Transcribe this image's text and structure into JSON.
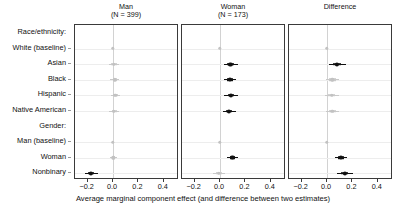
{
  "chart_data": {
    "type": "scatter",
    "plot_kind": "coefficient-forest-plot",
    "title": "",
    "xlabel": "Average marginal component effect (and difference between two estimates)",
    "ylabel": "",
    "xlim": [
      -0.3,
      0.52
    ],
    "xticks": [
      -0.2,
      0.0,
      0.2,
      0.4
    ],
    "xticklabels": [
      "−0.2",
      "0.0",
      "0.2",
      "0.4"
    ],
    "grid": false,
    "legend": "none",
    "reference_line": 0.0,
    "row_groups": [
      {
        "header": "Race/ethnicity:",
        "rows": [
          "White (baseline)",
          "Asian",
          "Black",
          "Hispanic",
          "Native American"
        ]
      },
      {
        "header": "Gender:",
        "rows": [
          "Man (baseline)",
          "Woman",
          "Nonbinary"
        ]
      }
    ],
    "categories": [
      "Race/ethnicity:",
      "White (baseline)",
      "Asian",
      "Black",
      "Hispanic",
      "Native American",
      "Gender:",
      "Man (baseline)",
      "Woman",
      "Nonbinary"
    ],
    "panels": [
      {
        "title": "Man",
        "subtitle": "(N = 399)",
        "points": [
          {
            "row": "White (baseline)",
            "estimate": 0.0,
            "lo": 0.0,
            "hi": 0.0,
            "lo_inner": 0.0,
            "hi_inner": 0.0,
            "significant": false
          },
          {
            "row": "Asian",
            "estimate": 0.005,
            "lo": -0.035,
            "hi": 0.045,
            "lo_inner": -0.018,
            "hi_inner": 0.028,
            "significant": false
          },
          {
            "row": "Black",
            "estimate": 0.012,
            "lo": -0.022,
            "hi": 0.046,
            "lo_inner": -0.004,
            "hi_inner": 0.028,
            "significant": false
          },
          {
            "row": "Hispanic",
            "estimate": 0.018,
            "lo": -0.018,
            "hi": 0.054,
            "lo_inner": 0.0,
            "hi_inner": 0.036,
            "significant": false
          },
          {
            "row": "Native American",
            "estimate": 0.008,
            "lo": -0.03,
            "hi": 0.046,
            "lo_inner": -0.012,
            "hi_inner": 0.028,
            "significant": false
          },
          {
            "row": "Man (baseline)",
            "estimate": 0.0,
            "lo": 0.0,
            "hi": 0.0,
            "lo_inner": 0.0,
            "hi_inner": 0.0,
            "significant": false
          },
          {
            "row": "Woman",
            "estimate": 0.002,
            "lo": -0.024,
            "hi": 0.028,
            "lo_inner": -0.01,
            "hi_inner": 0.014,
            "significant": false
          },
          {
            "row": "Nonbinary",
            "estimate": -0.175,
            "lo": -0.225,
            "hi": -0.12,
            "lo_inner": -0.198,
            "hi_inner": -0.152,
            "significant": true
          }
        ]
      },
      {
        "title": "Woman",
        "subtitle": "(N = 173)",
        "points": [
          {
            "row": "White (baseline)",
            "estimate": 0.0,
            "lo": 0.0,
            "hi": 0.0,
            "lo_inner": 0.0,
            "hi_inner": 0.0,
            "significant": false
          },
          {
            "row": "Asian",
            "estimate": 0.082,
            "lo": 0.028,
            "hi": 0.138,
            "lo_inner": 0.056,
            "hi_inner": 0.108,
            "significant": true
          },
          {
            "row": "Black",
            "estimate": 0.078,
            "lo": 0.03,
            "hi": 0.128,
            "lo_inner": 0.054,
            "hi_inner": 0.102,
            "significant": true
          },
          {
            "row": "Hispanic",
            "estimate": 0.086,
            "lo": 0.032,
            "hi": 0.14,
            "lo_inner": 0.06,
            "hi_inner": 0.112,
            "significant": true
          },
          {
            "row": "Native American",
            "estimate": 0.072,
            "lo": 0.022,
            "hi": 0.126,
            "lo_inner": 0.048,
            "hi_inner": 0.098,
            "significant": true
          },
          {
            "row": "Man (baseline)",
            "estimate": 0.0,
            "lo": 0.0,
            "hi": 0.0,
            "lo_inner": 0.0,
            "hi_inner": 0.0,
            "significant": false
          },
          {
            "row": "Woman",
            "estimate": 0.098,
            "lo": 0.058,
            "hi": 0.142,
            "lo_inner": 0.078,
            "hi_inner": 0.118,
            "significant": true
          },
          {
            "row": "Nonbinary",
            "estimate": -0.01,
            "lo": -0.058,
            "hi": 0.04,
            "lo_inner": -0.032,
            "hi_inner": 0.014,
            "significant": false
          }
        ]
      },
      {
        "title": "Difference",
        "subtitle": "",
        "points": [
          {
            "row": "White (baseline)",
            "estimate": 0.0,
            "lo": 0.0,
            "hi": 0.0,
            "lo_inner": 0.0,
            "hi_inner": 0.0,
            "significant": false
          },
          {
            "row": "Asian",
            "estimate": 0.08,
            "lo": 0.018,
            "hi": 0.148,
            "lo_inner": 0.05,
            "hi_inner": 0.112,
            "significant": true
          },
          {
            "row": "Black",
            "estimate": 0.04,
            "lo": -0.012,
            "hi": 0.098,
            "lo_inner": 0.014,
            "hi_inner": 0.068,
            "significant": false
          },
          {
            "row": "Hispanic",
            "estimate": 0.036,
            "lo": -0.014,
            "hi": 0.092,
            "lo_inner": 0.01,
            "hi_inner": 0.062,
            "significant": false
          },
          {
            "row": "Native American",
            "estimate": 0.042,
            "lo": -0.01,
            "hi": 0.098,
            "lo_inner": 0.016,
            "hi_inner": 0.07,
            "significant": false
          },
          {
            "row": "Man (baseline)",
            "estimate": 0.0,
            "lo": 0.0,
            "hi": 0.0,
            "lo_inner": 0.0,
            "hi_inner": 0.0,
            "significant": false
          },
          {
            "row": "Woman",
            "estimate": 0.108,
            "lo": 0.062,
            "hi": 0.158,
            "lo_inner": 0.086,
            "hi_inner": 0.132,
            "significant": true
          },
          {
            "row": "Nonbinary",
            "estimate": 0.138,
            "lo": 0.078,
            "hi": 0.202,
            "lo_inner": 0.11,
            "hi_inner": 0.168,
            "significant": true
          }
        ]
      }
    ]
  },
  "colors": {
    "significant": "#111111",
    "non_significant": "#c2c2c2",
    "panel_border": "#3a3a3a",
    "zero_line": "#d2d2d2",
    "background": "#ffffff"
  }
}
